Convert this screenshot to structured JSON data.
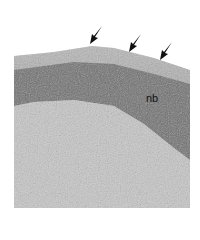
{
  "figure": {
    "labels": [
      {
        "text": "nb",
        "x": 146,
        "y": 92
      }
    ],
    "arrows": [
      {
        "x": 97,
        "y": 28
      },
      {
        "x": 136,
        "y": 36
      },
      {
        "x": 167,
        "y": 44
      }
    ],
    "colors": {
      "background": "#ffffff",
      "dark_tissue": "#6a6a6a",
      "mid_tissue": "#9a9a9a",
      "light_tissue": "#c4c4c4"
    }
  }
}
